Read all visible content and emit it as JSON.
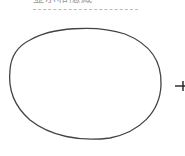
{
  "diagram": {
    "title": "显示和隐藏",
    "shape": "hand-drawn-oval",
    "stroke_color": "#444444",
    "arrow": "right-arrow"
  }
}
